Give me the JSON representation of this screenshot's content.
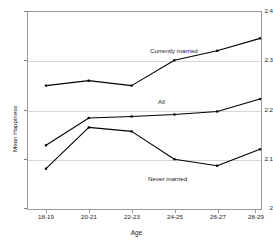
{
  "chart_data": {
    "type": "line",
    "title": "",
    "xlabel": "Age",
    "ylabel": "Mean Happiness",
    "categories": [
      "18-19",
      "20-21",
      "22-23",
      "24-25",
      "26-27",
      "28-29"
    ],
    "ylim": [
      2.0,
      2.4
    ],
    "yticks": [
      "2",
      "2.1",
      "2.2",
      "2.3",
      "2.4"
    ],
    "ytick_values": [
      2.0,
      2.1,
      2.2,
      2.3,
      2.4
    ],
    "grid": "horizontal",
    "legend_position": "inline-annotations",
    "series": [
      {
        "name": "Currently married",
        "values": [
          2.25,
          2.26,
          2.25,
          2.301,
          2.32,
          2.345
        ],
        "color": "#000000",
        "label_x": 150,
        "label_y": 48
      },
      {
        "name": "All",
        "values": [
          2.13,
          2.185,
          2.188,
          2.192,
          2.198,
          2.223
        ],
        "color": "#000000",
        "label_x": 158,
        "label_y": 99
      },
      {
        "name": "Never married",
        "values": [
          2.083,
          2.166,
          2.158,
          2.102,
          2.089,
          2.122
        ],
        "color": "#000000",
        "label_x": 148,
        "label_y": 176
      }
    ]
  },
  "axes": {
    "y_title": "Mean Happiness",
    "x_title": "Age",
    "y_labels": [
      "2.4",
      "2.3",
      "2.2",
      "2.1",
      "2"
    ],
    "x_labels": [
      "18-19",
      "20-21",
      "22-23",
      "24-25",
      "26-27",
      "28-29"
    ]
  },
  "annotations": {
    "currently_married": "Currently married",
    "all": "All",
    "never_married": "Never married"
  },
  "colors": {
    "line": "#000000",
    "grid": "#d6d6d6",
    "frame": "#9a9a9a",
    "background": "#ffffff",
    "text": "#1a1a1a"
  }
}
